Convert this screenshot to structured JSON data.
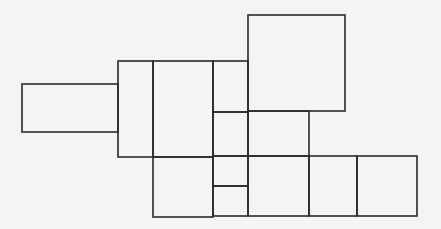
{
  "diagram": {
    "width": 441,
    "height": 229,
    "background": "#f4f4f4",
    "stroke": "#2a2a2a",
    "rects": [
      {
        "id": "left-wing",
        "x": 22,
        "y": 84,
        "w": 96,
        "h": 48
      },
      {
        "id": "connector-block",
        "x": 118,
        "y": 61,
        "w": 35,
        "h": 96
      },
      {
        "id": "center-upper",
        "x": 153,
        "y": 61,
        "w": 60,
        "h": 96
      },
      {
        "id": "center-lower",
        "x": 153,
        "y": 157,
        "w": 60,
        "h": 60
      },
      {
        "id": "narrow-top",
        "x": 213,
        "y": 61,
        "w": 35,
        "h": 51
      },
      {
        "id": "narrow-mid",
        "x": 213,
        "y": 112,
        "w": 35,
        "h": 44
      },
      {
        "id": "narrow-low",
        "x": 213,
        "y": 156,
        "w": 35,
        "h": 30
      },
      {
        "id": "narrow-bottom",
        "x": 213,
        "y": 186,
        "w": 35,
        "h": 30
      },
      {
        "id": "top-square",
        "x": 248,
        "y": 15,
        "w": 97,
        "h": 96
      },
      {
        "id": "mid-block",
        "x": 248,
        "y": 111,
        "w": 61,
        "h": 45
      },
      {
        "id": "bottom-1",
        "x": 248,
        "y": 156,
        "w": 61,
        "h": 60
      },
      {
        "id": "bottom-2",
        "x": 309,
        "y": 156,
        "w": 48,
        "h": 60
      },
      {
        "id": "bottom-3",
        "x": 357,
        "y": 156,
        "w": 60,
        "h": 60
      }
    ]
  }
}
